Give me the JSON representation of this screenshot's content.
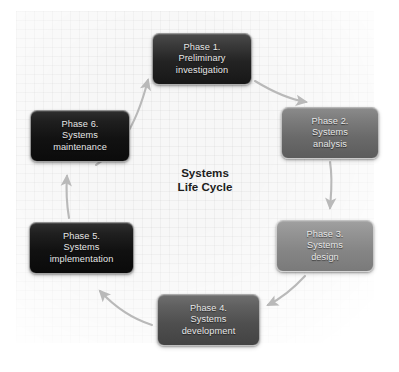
{
  "diagram": {
    "title": "Systems\nLife Cycle",
    "background_color": "#f7f7f7",
    "arrow_color": "#b9b9b9",
    "text_color": "#e8e8e8",
    "title_color": "#1d1d1d",
    "phases": [
      {
        "id": "phase-1",
        "number": "Phase 1.",
        "name": "Preliminary investigation",
        "label": "Phase 1.\nPreliminary\ninvestigation",
        "fill": "#232323"
      },
      {
        "id": "phase-2",
        "number": "Phase 2.",
        "name": "Systems analysis",
        "label": "Phase 2.\nSystems\nanalysis",
        "fill": "#6a6a6a"
      },
      {
        "id": "phase-3",
        "number": "Phase 3.",
        "name": "Systems design",
        "label": "Phase 3.\nSystems\ndesign",
        "fill": "#858585"
      },
      {
        "id": "phase-4",
        "number": "Phase 4.",
        "name": "Systems development",
        "label": "Phase 4.\nSystems\ndevelopment",
        "fill": "#4e4e4e"
      },
      {
        "id": "phase-5",
        "number": "Phase 5.",
        "name": "Systems implementation",
        "label": "Phase 5.\nSystems\nimplementation",
        "fill": "#111111"
      },
      {
        "id": "phase-6",
        "number": "Phase 6.",
        "name": "Systems maintenance",
        "label": "Phase 6.\nSystems\nmaintenance",
        "fill": "#121212"
      }
    ],
    "arrows": [
      {
        "id": "arrow-1-to-2",
        "from": "Phase 1.",
        "to": "Phase 2."
      },
      {
        "id": "arrow-2-to-3",
        "from": "Phase 2.",
        "to": "Phase 3."
      },
      {
        "id": "arrow-3-to-4",
        "from": "Phase 3.",
        "to": "Phase 4."
      },
      {
        "id": "arrow-4-to-5",
        "from": "Phase 4.",
        "to": "Phase 5."
      },
      {
        "id": "arrow-5-to-6",
        "from": "Phase 5.",
        "to": "Phase 6."
      },
      {
        "id": "arrow-6-to-1",
        "from": "Phase 6.",
        "to": "Phase 1."
      }
    ]
  }
}
